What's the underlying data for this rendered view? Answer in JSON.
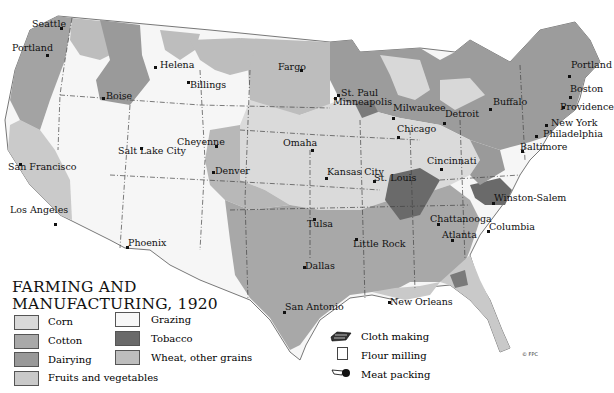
{
  "title_line1": "FARMING AND",
  "title_line2": "MANUFACTURING, 1920",
  "legend": {
    "regions": [
      {
        "label": "Corn",
        "color": "#d9d9d9"
      },
      {
        "label": "Cotton",
        "color": "#a9a9a9"
      },
      {
        "label": "Dairying",
        "color": "#999999"
      },
      {
        "label": "Fruits and vegetables",
        "color": "#c9c9c9"
      },
      {
        "label": "Grazing",
        "color": "#f7f7f7"
      },
      {
        "label": "Tobacco",
        "color": "#6a6a6a"
      },
      {
        "label": "Wheat, other grains",
        "color": "#bdbdbd"
      }
    ],
    "industries": [
      {
        "label": "Cloth making",
        "icon": "cloth-icon"
      },
      {
        "label": "Flour milling",
        "icon": "flour-icon"
      },
      {
        "label": "Meat packing",
        "icon": "meat-icon"
      }
    ]
  },
  "cities": [
    {
      "name": "Seattle",
      "x": 32,
      "y": 19,
      "dx": 60,
      "dy": 27
    },
    {
      "name": "Portland",
      "x": 12,
      "y": 43,
      "dx": 46,
      "dy": 54
    },
    {
      "name": "Helena",
      "x": 160,
      "y": 60,
      "dx": 154,
      "dy": 66
    },
    {
      "name": "Boise",
      "x": 106,
      "y": 91,
      "dx": 102,
      "dy": 97
    },
    {
      "name": "Billings",
      "x": 190,
      "y": 80,
      "dx": 187,
      "dy": 81
    },
    {
      "name": "Fargo",
      "x": 278,
      "y": 62,
      "dx": 300,
      "dy": 69
    },
    {
      "name": "St. Paul",
      "x": 341,
      "y": 88,
      "dx": 337,
      "dy": 94
    },
    {
      "name": "Minneapolis",
      "x": 333,
      "y": 97,
      "dx": 334,
      "dy": 97
    },
    {
      "name": "Milwaukee",
      "x": 393,
      "y": 103,
      "dx": 392,
      "dy": 117
    },
    {
      "name": "Detroit",
      "x": 445,
      "y": 109,
      "dx": 443,
      "dy": 122
    },
    {
      "name": "Buffalo",
      "x": 493,
      "y": 97,
      "dx": 489,
      "dy": 108
    },
    {
      "name": "Portland",
      "x": 571,
      "y": 60,
      "dx": 568,
      "dy": 75
    },
    {
      "name": "Boston",
      "x": 570,
      "y": 84,
      "dx": 569,
      "dy": 96
    },
    {
      "name": "Providence",
      "x": 560,
      "y": 102,
      "dx": 562,
      "dy": 106
    },
    {
      "name": "New York",
      "x": 551,
      "y": 118,
      "dx": 545,
      "dy": 124
    },
    {
      "name": "Philadelphia",
      "x": 543,
      "y": 129,
      "dx": 535,
      "dy": 135
    },
    {
      "name": "Baltimore",
      "x": 520,
      "y": 142,
      "dx": 521,
      "dy": 150
    },
    {
      "name": "Chicago",
      "x": 397,
      "y": 124,
      "dx": 397,
      "dy": 136
    },
    {
      "name": "Cincinnati",
      "x": 427,
      "y": 156,
      "dx": 440,
      "dy": 168
    },
    {
      "name": "Cheyenne",
      "x": 177,
      "y": 137,
      "dx": 215,
      "dy": 145
    },
    {
      "name": "Salt Lake City",
      "x": 118,
      "y": 146,
      "dx": 140,
      "dy": 147
    },
    {
      "name": "Denver",
      "x": 215,
      "y": 166,
      "dx": 212,
      "dy": 171
    },
    {
      "name": "Omaha",
      "x": 283,
      "y": 138,
      "dx": 311,
      "dy": 149
    },
    {
      "name": "Kansas City",
      "x": 327,
      "y": 167,
      "dx": 325,
      "dy": 177
    },
    {
      "name": "St. Louis",
      "x": 374,
      "y": 173,
      "dx": 373,
      "dy": 180
    },
    {
      "name": "San Francisco",
      "x": 8,
      "y": 162,
      "dx": 19,
      "dy": 163
    },
    {
      "name": "Los Angeles",
      "x": 10,
      "y": 205,
      "dx": 54,
      "dy": 223
    },
    {
      "name": "Phoenix",
      "x": 128,
      "y": 238,
      "dx": 126,
      "dy": 246
    },
    {
      "name": "Winston-Salem",
      "x": 494,
      "y": 193,
      "dx": 492,
      "dy": 202
    },
    {
      "name": "Chattanooga",
      "x": 430,
      "y": 214,
      "dx": 437,
      "dy": 223
    },
    {
      "name": "Columbia",
      "x": 489,
      "y": 222,
      "dx": 487,
      "dy": 230
    },
    {
      "name": "Atlanta",
      "x": 442,
      "y": 230,
      "dx": 451,
      "dy": 239
    },
    {
      "name": "Tulsa",
      "x": 307,
      "y": 219,
      "dx": 313,
      "dy": 218
    },
    {
      "name": "Little Rock",
      "x": 353,
      "y": 239,
      "dx": 355,
      "dy": 238
    },
    {
      "name": "Dallas",
      "x": 305,
      "y": 261,
      "dx": 303,
      "dy": 266
    },
    {
      "name": "San Antonio",
      "x": 285,
      "y": 302,
      "dx": 283,
      "dy": 311
    },
    {
      "name": "New Orleans",
      "x": 390,
      "y": 297,
      "dx": 388,
      "dy": 301
    }
  ],
  "copyright": "© FPC"
}
